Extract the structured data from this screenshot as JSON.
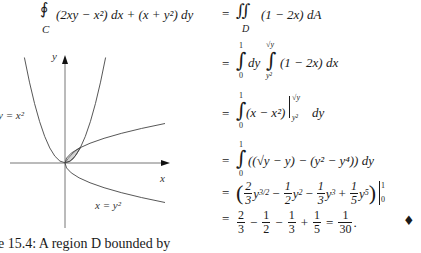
{
  "lhs": {
    "integral_symbol": "∮",
    "subscript": "C",
    "expression": "(2xy − x²) dx + (x + y²) dy"
  },
  "steps": [
    {
      "rhs": "∬ (1 − 2x) dA",
      "integrand": "(1 − 2x) dA",
      "lower": "D"
    },
    {
      "rhs": "∫₀¹ dy ∫_{y²}^{√y} (1 − 2x) dx",
      "outer_upper": "1",
      "outer_lower": "0",
      "middle": "dy",
      "inner_upper": "√y",
      "inner_lower": "y²",
      "integrand": "(1 − 2x) dx"
    },
    {
      "rhs": "∫₀¹ (x − x²)|_{y²}^{√y} dy",
      "upper": "1",
      "lower": "0",
      "integrand": "(x − x²)",
      "eval_upper": "√y",
      "eval_lower": "y²",
      "tail": "dy"
    },
    {
      "rhs": "∫₀¹ ((√y − y) − (y² − y⁴)) dy",
      "upper": "1",
      "lower": "0",
      "integrand": "((√y − y) − (y² − y⁴)) dy"
    },
    {
      "rhs": "(2/3 y^{3/2} − 1/2 y² − 1/3 y³ + 1/5 y⁵) |₀¹",
      "terms": [
        {
          "sign": "",
          "num": "2",
          "den": "3",
          "var": "y",
          "exp": "3/2"
        },
        {
          "sign": "−",
          "num": "1",
          "den": "2",
          "var": "y",
          "exp": "2"
        },
        {
          "sign": "−",
          "num": "1",
          "den": "3",
          "var": "y",
          "exp": "3"
        },
        {
          "sign": "+",
          "num": "1",
          "den": "5",
          "var": "y",
          "exp": "5"
        }
      ],
      "eval_upper": "1",
      "eval_lower": "0"
    },
    {
      "rhs": "2/3 − 1/2 − 1/3 + 1/5 = 1/30.",
      "fractions": [
        {
          "num": "2",
          "den": "3"
        },
        {
          "num": "1",
          "den": "2"
        },
        {
          "num": "1",
          "den": "3"
        },
        {
          "num": "1",
          "den": "5"
        }
      ],
      "signs": [
        "−",
        "−",
        "+"
      ],
      "result": {
        "num": "1",
        "den": "30"
      },
      "end_mark": "♦"
    }
  ],
  "figure": {
    "labels": {
      "y_axis": "y",
      "x_axis": "x",
      "parabola": "y = x²",
      "sideways_parabola": "x = y²"
    },
    "region_fill": "#d4d4d4",
    "caption": "e 15.4: A region D bounded by"
  },
  "equals": "="
}
